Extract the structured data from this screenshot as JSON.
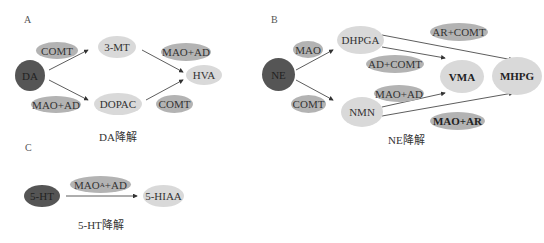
{
  "panels": {
    "A": {
      "label": "A",
      "caption": "DA降解",
      "nodes": {
        "DA": "DA",
        "COMT": "COMT",
        "MT3": "3-MT",
        "MAOAD1": "MAO+AD",
        "HVA": "HVA",
        "MAOAD2": "MAO+AD",
        "DOPAC": "DOPAC",
        "COMT2": "COMT"
      }
    },
    "B": {
      "label": "B",
      "caption": "NE降解",
      "nodes": {
        "NE": "NE",
        "MAO": "MAO",
        "DHPGA": "DHPGA",
        "ARCOMT": "AR+COMT",
        "ADCOMT": "AD+COMT",
        "VMA": "VMA",
        "MHPG": "MHPG",
        "MAOAD": "MAO+AD",
        "COMT": "COMT",
        "NMN": "NMN",
        "MAOAR": "MAO+AR"
      }
    },
    "C": {
      "label": "C",
      "caption": "5-HT降解",
      "nodes": {
        "HT5": "5-HT",
        "MAOA_main": "MAO",
        "MAOA_sub": "A",
        "MAOA_rest": "+AD",
        "HIAA": "5-HIAA"
      }
    }
  },
  "colors": {
    "light": "#d9d9d9",
    "mid": "#b3b3b3",
    "dark": "#555555"
  }
}
